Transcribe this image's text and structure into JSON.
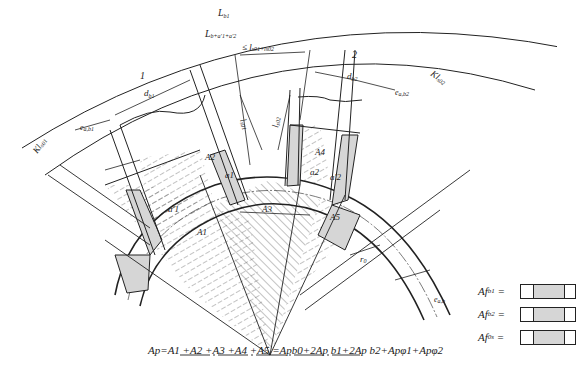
{
  "diagram": {
    "type": "cross-section of ring with two cutouts and hatched area decomposition",
    "dimension_labels": {
      "L_b1": "L",
      "L_b1_sub": "b1",
      "L_b_sum": "L",
      "L_b_sum_rest": "b+a'1+a'2",
      "l_sum": "≤ l",
      "l_sum_rest": "s01+ls02",
      "region_1": "1",
      "region_2": "2",
      "d_b1": "d",
      "d_b1_sub": "b1",
      "d_b2": "d",
      "d_b2_sub": "b2",
      "e_ab1": "e",
      "e_ab1_sub": "a,b1",
      "e_ab2": "e",
      "e_ab2_sub": "a,b2",
      "e_ab": "e",
      "e_ab_sub": "a,b",
      "Kl_s01": "Kl",
      "Kl_s01_sub": "s01",
      "Kl_s02": "Kl",
      "Kl_s02_sub": "s02",
      "l_s01": "l",
      "l_s01_sub": "s01",
      "l_s02": "l",
      "l_s02_sub": "s02",
      "r0": "r",
      "r0_sub": "0"
    },
    "area_labels": [
      "A1",
      "A2",
      "A3",
      "A4",
      "A5"
    ],
    "gap_labels": [
      "a1",
      "a'1",
      "a2",
      "a'2"
    ],
    "formula": "Ap=A1 +A2 +A3 +A4 +A5 =Apb0+2Ap b1+2Ap b2+Apφ1+Apφ2",
    "legend": [
      {
        "label": "Af",
        "sub": "b1",
        "eq": "="
      },
      {
        "label": "Af",
        "sub": "b2",
        "eq": "="
      },
      {
        "label": "Af",
        "sub": "0s",
        "eq": "="
      }
    ],
    "colors": {
      "line": "#222222",
      "fill_gray": "#d6d6d6",
      "background": "#ffffff"
    }
  }
}
